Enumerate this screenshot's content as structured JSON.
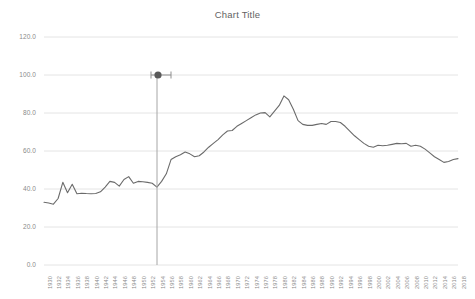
{
  "chart": {
    "title": "Chart Title",
    "cursor_icon": "horizontal-resize-cursor"
  },
  "chart_data": {
    "type": "line",
    "title": "Chart Title",
    "xlabel": "",
    "ylabel": "",
    "ylim": [
      0.0,
      120.0
    ],
    "yticks": [
      "0.0",
      "20.0",
      "40.0",
      "60.0",
      "80.0",
      "100.0",
      "120.0"
    ],
    "ytick_values": [
      0.0,
      20.0,
      40.0,
      60.0,
      80.0,
      100.0,
      120.0
    ],
    "grid": true,
    "legend": false,
    "legend_position": "none",
    "line_color": "#6b6b6b",
    "xtick_step": 2,
    "xtick_labels": [
      "1930",
      "1932",
      "1934",
      "1936",
      "1938",
      "1940",
      "1942",
      "1944",
      "1946",
      "1948",
      "1950",
      "1952",
      "1954",
      "1956",
      "1958",
      "1960",
      "1962",
      "1964",
      "1966",
      "1968",
      "1970",
      "1972",
      "1974",
      "1976",
      "1978",
      "1980",
      "1982",
      "1984",
      "1986",
      "1988",
      "1990",
      "1992",
      "1994",
      "1996",
      "1998",
      "2000",
      "2002",
      "2004",
      "2006",
      "2008",
      "2010",
      "2012",
      "2014",
      "2016",
      "2018"
    ],
    "x": [
      1930,
      1931,
      1932,
      1933,
      1934,
      1935,
      1936,
      1937,
      1938,
      1939,
      1940,
      1941,
      1942,
      1943,
      1944,
      1945,
      1946,
      1947,
      1948,
      1949,
      1950,
      1951,
      1952,
      1953,
      1954,
      1955,
      1956,
      1957,
      1958,
      1959,
      1960,
      1961,
      1962,
      1963,
      1964,
      1965,
      1966,
      1967,
      1968,
      1969,
      1970,
      1971,
      1972,
      1973,
      1974,
      1975,
      1976,
      1977,
      1978,
      1979,
      1980,
      1981,
      1982,
      1983,
      1984,
      1985,
      1986,
      1987,
      1988,
      1989,
      1990,
      1991,
      1992,
      1993,
      1994,
      1995,
      1996,
      1997,
      1998,
      1999,
      2000,
      2001,
      2002,
      2003,
      2004,
      2005,
      2006,
      2007,
      2008,
      2009,
      2010,
      2011,
      2012,
      2013,
      2014,
      2015,
      2016,
      2017,
      2018
    ],
    "values": [
      33.0,
      32.6,
      32.0,
      35.0,
      43.5,
      38.0,
      42.5,
      37.5,
      37.8,
      37.6,
      37.5,
      37.6,
      38.5,
      41.0,
      44.0,
      43.5,
      41.5,
      45.0,
      46.5,
      43.0,
      44.0,
      43.8,
      43.5,
      43.0,
      41.0,
      44.0,
      48.0,
      55.5,
      57.0,
      58.0,
      59.5,
      58.5,
      57.0,
      57.5,
      59.5,
      62.0,
      64.0,
      66.0,
      68.5,
      70.5,
      70.8,
      73.0,
      74.5,
      76.0,
      77.5,
      79.0,
      80.0,
      80.2,
      78.0,
      81.0,
      84.0,
      89.0,
      87.0,
      82.0,
      76.0,
      74.0,
      73.5,
      73.5,
      74.0,
      74.5,
      74.0,
      75.5,
      75.5,
      75.0,
      73.0,
      70.5,
      68.0,
      66.0,
      64.0,
      62.5,
      62.0,
      63.0,
      62.8,
      63.0,
      63.5,
      64.0,
      63.8,
      64.0,
      62.5,
      63.0,
      62.5,
      61.0,
      59.0,
      57.0,
      55.5,
      54.0,
      54.5,
      55.5,
      56.0
    ]
  }
}
